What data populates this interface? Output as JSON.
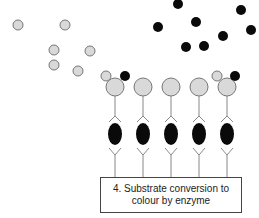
{
  "caption": {
    "line1": "4. Substrate conversion to",
    "line2": "colour by enzyme"
  },
  "colors": {
    "substrate_grey": "#d9d9d9",
    "outline": "#777777",
    "product_black": "#0a0a0a",
    "line": "#888888"
  },
  "free_grey_molecules": [
    {
      "x": 18,
      "y": 25
    },
    {
      "x": 65,
      "y": 25
    },
    {
      "x": 54,
      "y": 50
    },
    {
      "x": 90,
      "y": 51
    },
    {
      "x": 54,
      "y": 65
    },
    {
      "x": 78,
      "y": 71
    }
  ],
  "free_black_molecules": [
    {
      "x": 178,
      "y": 4
    },
    {
      "x": 158,
      "y": 27
    },
    {
      "x": 196,
      "y": 22
    },
    {
      "x": 186,
      "y": 47
    },
    {
      "x": 204,
      "y": 46
    },
    {
      "x": 223,
      "y": 36
    },
    {
      "x": 241,
      "y": 10
    },
    {
      "x": 251,
      "y": 30
    }
  ],
  "columns": [
    115,
    143,
    171,
    199,
    227
  ],
  "bound_pairs": [
    {
      "grey": {
        "x": 106,
        "y": 76
      },
      "black": {
        "x": 125,
        "y": 76
      }
    },
    {
      "grey": {
        "x": 217,
        "y": 76
      },
      "black": {
        "x": 235,
        "y": 76
      }
    }
  ]
}
